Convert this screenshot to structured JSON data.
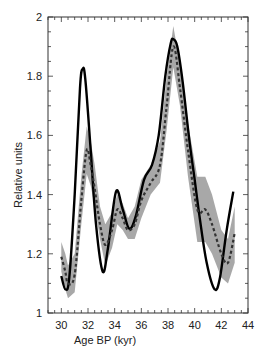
{
  "chart_data": {
    "type": "line",
    "title": "",
    "xlabel": "Age BP (kyr)",
    "ylabel": "Relative units",
    "xlim": [
      29,
      44
    ],
    "ylim": [
      1,
      2
    ],
    "xticks": [
      30,
      32,
      34,
      36,
      38,
      40,
      42,
      44
    ],
    "yticks": [
      1,
      1.2,
      1.4,
      1.6,
      1.8,
      2
    ],
    "xtick_labels": [
      "30",
      "32",
      "34",
      "36",
      "38",
      "40",
      "42",
      "44"
    ],
    "ytick_labels": [
      "1",
      "1.2",
      "1.4",
      "1.6",
      "1.8",
      "2"
    ],
    "grid": false,
    "series": [
      {
        "name": "solid",
        "style": "solid",
        "color": "#000000",
        "x": [
          30.0,
          30.3,
          30.6,
          31.0,
          31.4,
          31.6,
          31.8,
          32.2,
          32.6,
          33.1,
          33.5,
          34.1,
          34.6,
          35.1,
          35.6,
          36.2,
          36.8,
          37.3,
          37.8,
          38.2,
          38.4,
          38.7,
          39.1,
          39.6,
          40.0,
          40.4,
          40.9,
          41.5,
          41.9,
          42.4,
          42.9
        ],
        "y": [
          1.125,
          1.08,
          1.12,
          1.4,
          1.76,
          1.825,
          1.79,
          1.55,
          1.3,
          1.14,
          1.22,
          1.41,
          1.35,
          1.285,
          1.33,
          1.45,
          1.5,
          1.6,
          1.8,
          1.91,
          1.925,
          1.9,
          1.78,
          1.585,
          1.45,
          1.315,
          1.17,
          1.08,
          1.12,
          1.28,
          1.41
        ]
      },
      {
        "name": "dashed",
        "style": "dashed",
        "color": "#333333",
        "x": [
          30.0,
          30.3,
          30.5,
          31.0,
          31.5,
          31.9,
          32.2,
          32.5,
          32.9,
          33.3,
          33.8,
          34.2,
          34.6,
          35.0,
          35.5,
          36.0,
          36.7,
          37.4,
          37.9,
          38.4,
          38.9,
          39.5,
          40.2,
          40.8,
          41.3,
          42.0,
          42.5,
          43.0
        ],
        "y": [
          1.19,
          1.14,
          1.1,
          1.13,
          1.38,
          1.55,
          1.5,
          1.42,
          1.3,
          1.23,
          1.28,
          1.35,
          1.32,
          1.28,
          1.3,
          1.38,
          1.44,
          1.5,
          1.7,
          1.9,
          1.76,
          1.55,
          1.35,
          1.35,
          1.3,
          1.2,
          1.17,
          1.27
        ]
      }
    ],
    "uncertainty_band": {
      "name": "grey-envelope",
      "color": "#999999",
      "x": [
        30.0,
        30.3,
        30.5,
        31.0,
        31.5,
        31.9,
        32.2,
        32.5,
        32.9,
        33.3,
        33.8,
        34.2,
        34.6,
        35.0,
        35.5,
        36.0,
        36.7,
        37.4,
        37.9,
        38.4,
        38.9,
        39.5,
        40.2,
        40.8,
        41.3,
        42.0,
        42.5,
        43.0
      ],
      "lower": [
        1.14,
        1.08,
        1.05,
        1.07,
        1.3,
        1.47,
        1.43,
        1.36,
        1.25,
        1.16,
        1.22,
        1.3,
        1.28,
        1.25,
        1.25,
        1.32,
        1.4,
        1.44,
        1.62,
        1.83,
        1.7,
        1.46,
        1.24,
        1.24,
        1.2,
        1.12,
        1.1,
        1.17
      ],
      "upper": [
        1.24,
        1.2,
        1.16,
        1.2,
        1.46,
        1.63,
        1.58,
        1.5,
        1.36,
        1.3,
        1.34,
        1.4,
        1.37,
        1.32,
        1.36,
        1.45,
        1.5,
        1.58,
        1.8,
        1.97,
        1.84,
        1.64,
        1.46,
        1.46,
        1.4,
        1.28,
        1.25,
        1.36
      ]
    },
    "legend": "none"
  }
}
